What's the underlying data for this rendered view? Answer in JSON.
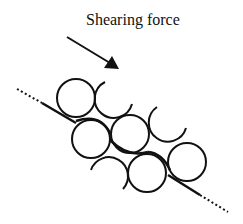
{
  "diagram": {
    "title": "Shearing force",
    "arrow": {
      "from": [
        67,
        37
      ],
      "to": [
        118,
        68
      ],
      "label_ref": "Shearing force"
    },
    "colors": {
      "stroke": "#111111",
      "background": "#ffffff"
    },
    "particles": {
      "full_circles": [
        {
          "cx": 76,
          "cy": 98,
          "r": 19
        },
        {
          "cx": 91,
          "cy": 139,
          "r": 19
        },
        {
          "cx": 130,
          "cy": 134,
          "r": 19
        },
        {
          "cx": 147,
          "cy": 173,
          "r": 19
        },
        {
          "cx": 187,
          "cy": 162,
          "r": 19
        }
      ],
      "partial_arcs": [
        {
          "cx": 115,
          "cy": 98,
          "r": 19
        },
        {
          "cx": 167,
          "cy": 123,
          "r": 19
        },
        {
          "cx": 108,
          "cy": 176,
          "r": 19
        }
      ]
    },
    "shear_plane": {
      "solid_segments": "tangent to lower-left of particle chain",
      "dotted_ends": true
    }
  }
}
